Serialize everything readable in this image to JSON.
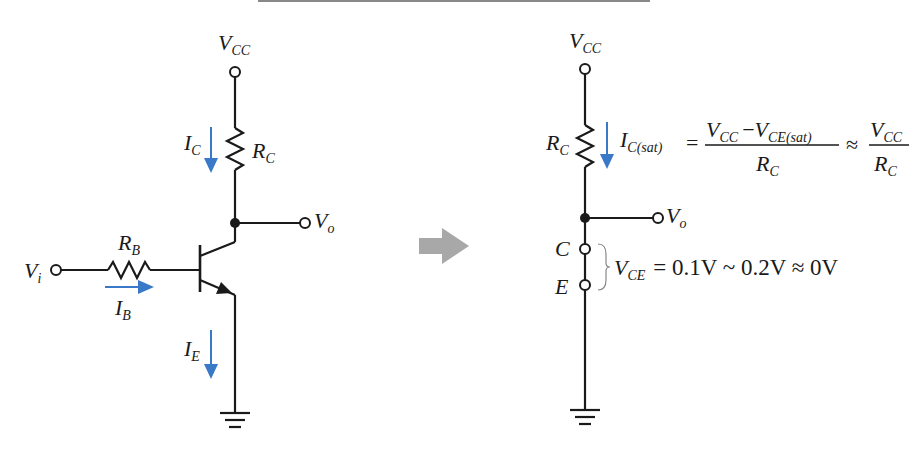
{
  "left_circuit": {
    "vcc": {
      "main": "V",
      "sub": "CC"
    },
    "rc": {
      "main": "R",
      "sub": "C"
    },
    "ic": {
      "main": "I",
      "sub": "C"
    },
    "vo": {
      "main": "V",
      "sub": "o"
    },
    "rb": {
      "main": "R",
      "sub": "B"
    },
    "vi": {
      "main": "V",
      "sub": "i"
    },
    "ib": {
      "main": "I",
      "sub": "B"
    },
    "ie": {
      "main": "I",
      "sub": "E"
    }
  },
  "transition_arrow": {
    "color": "#a8a8a8"
  },
  "right_circuit": {
    "vcc": {
      "main": "V",
      "sub": "CC"
    },
    "rc": {
      "main": "R",
      "sub": "C"
    },
    "ic_sat": {
      "main": "I",
      "sub": "C(sat)"
    },
    "equation_1": {
      "equals": "=",
      "numerator_a": {
        "main": "V",
        "sub": "CC"
      },
      "minus": "−",
      "numerator_b": {
        "main": "V",
        "sub": "CE(sat)"
      },
      "denominator": {
        "main": "R",
        "sub": "C"
      },
      "approx": "≈",
      "frac2_num": {
        "main": "V",
        "sub": "CC"
      },
      "frac2_den": {
        "main": "R",
        "sub": "C"
      }
    },
    "vo": {
      "main": "V",
      "sub": "o"
    },
    "node_c": "C",
    "node_e": "E",
    "equation_2": {
      "lhs": {
        "main": "V",
        "sub": "CE"
      },
      "rhs": "= 0.1V ~ 0.2V ≈ 0V"
    }
  },
  "colors": {
    "wire": "#1a1a1a",
    "current_arrow": "#3a78c8",
    "transition_arrow": "#a8a8a8"
  }
}
